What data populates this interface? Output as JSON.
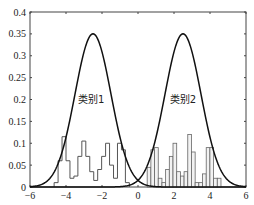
{
  "chart_data": {
    "type": "line",
    "title": "",
    "xlabel": "",
    "ylabel": "",
    "xlim": [
      -6,
      6
    ],
    "ylim": [
      0,
      0.4
    ],
    "xticks": [
      -6,
      -4,
      -2,
      0,
      2,
      4,
      6
    ],
    "xtick_labels": [
      "-6",
      "-4",
      "-2",
      "0",
      "2",
      "4",
      "6"
    ],
    "yticks": [
      0,
      0.05,
      0.1,
      0.15,
      0.2,
      0.25,
      0.3,
      0.35,
      0.4
    ],
    "ytick_labels": [
      "0",
      "0.05",
      "0.1",
      "0.15",
      "0.2",
      "0.25",
      "0.3",
      "0.35",
      "0.4"
    ],
    "grid": false,
    "series": [
      {
        "name": "类别1 density",
        "kind": "gaussian-curve",
        "mean": -2.5,
        "sigma": 1.0,
        "peak": 0.35,
        "color": "#111111"
      },
      {
        "name": "类别2 density",
        "kind": "gaussian-curve",
        "mean": 2.5,
        "sigma": 1.0,
        "peak": 0.35,
        "color": "#111111"
      },
      {
        "name": "类别1 histogram",
        "kind": "stair-outline",
        "bin_start": -4.66,
        "bin_width": 0.22,
        "values": [
          0.01,
          0.06,
          0.115,
          0.06,
          0.02,
          0.025,
          0.07,
          0.105,
          0.07,
          0.035,
          0.015,
          0.04,
          0.07,
          0.1,
          0.05,
          0.02,
          0.1,
          0.085,
          0.01
        ],
        "color": "#555555"
      },
      {
        "name": "类别2 histogram",
        "kind": "bars",
        "bin_start": 0.51,
        "bin_width": 0.205,
        "values": [
          0.045,
          0.085,
          0.09,
          0.02,
          0.01,
          0.04,
          0.07,
          0.1,
          0.035,
          0.025,
          0.035,
          0.12,
          0.08,
          0.01,
          0.01,
          0.03,
          0.09,
          0.09,
          0.02,
          0.02
        ],
        "color": "#666666",
        "fill": "#f2f2f2"
      }
    ],
    "annotations": [
      {
        "text": "类别1",
        "x": -2.6,
        "y": 0.2
      },
      {
        "text": "类别2",
        "x": 2.5,
        "y": 0.2
      }
    ]
  }
}
